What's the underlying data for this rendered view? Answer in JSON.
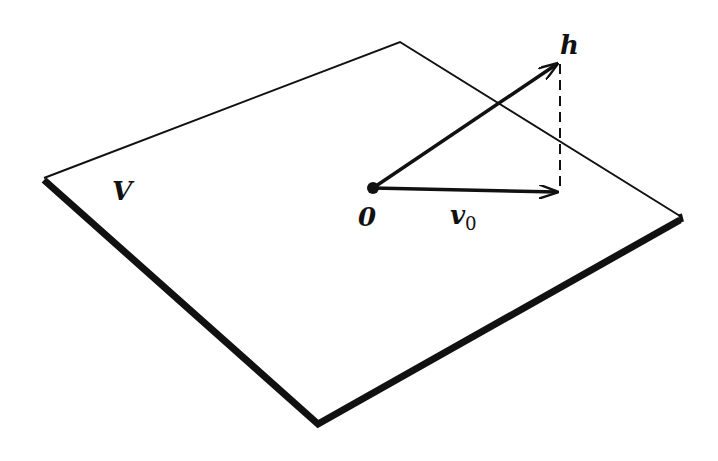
{
  "diagram": {
    "plane_label": "V",
    "origin_label": "0",
    "vector_h_label": "h",
    "vector_v0_label": "v",
    "vector_v0_subscript": "0",
    "colors": {
      "stroke": "#111111",
      "background": "#ffffff"
    }
  }
}
